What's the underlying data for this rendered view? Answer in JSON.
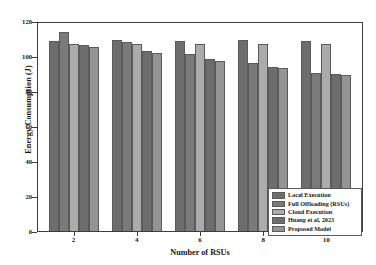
{
  "chart_data": {
    "type": "bar",
    "title": "",
    "xlabel": "Number of RSUs",
    "ylabel": "Energy Consumption (J)",
    "categories": [
      "2",
      "4",
      "6",
      "8",
      "10"
    ],
    "ylim": [
      0,
      120
    ],
    "yticks": [
      0,
      20,
      40,
      60,
      80,
      100,
      120
    ],
    "grid": false,
    "legend_position": "lower-right",
    "series": [
      {
        "name": "Local Execution",
        "color": "#6d6d6d",
        "values": [
          108.5,
          109.0,
          108.5,
          109.0,
          108.5
        ]
      },
      {
        "name": "Full Offloading (RSUs)",
        "color": "#7a7a7a",
        "values": [
          113.5,
          108.0,
          101.0,
          96.0,
          90.5
        ]
      },
      {
        "name": "Cloud Execution",
        "color": "#ababab",
        "values": [
          107.0,
          107.0,
          107.0,
          107.0,
          107.0
        ]
      },
      {
        "name": "Huang et al, 2023",
        "color": "#6d6d6d",
        "values": [
          106.5,
          103.0,
          98.5,
          94.0,
          89.5
        ]
      },
      {
        "name": "Proposed Model",
        "color": "#949494",
        "values": [
          105.0,
          101.5,
          97.0,
          93.0,
          89.0
        ]
      }
    ]
  },
  "legend": {
    "items": [
      "Local Execution",
      "Full Offloading (RSUs)",
      "Cloud Execution",
      "Huang et al, 2023",
      "Proposed Model"
    ]
  }
}
